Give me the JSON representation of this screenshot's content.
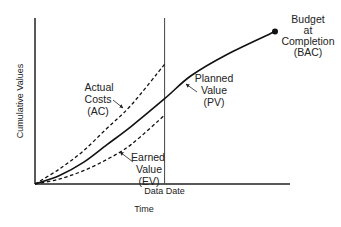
{
  "chart_data": {
    "type": "line",
    "title": "",
    "xlabel": "Time",
    "ylabel": "Cumulative Values",
    "grid": false,
    "data_date_label": "Data Date",
    "data_date_x": 0.54,
    "series": [
      {
        "name": "Planned Value (PV)",
        "label_lines": [
          "Planned",
          "Value",
          "(PV)"
        ],
        "style": "solid",
        "points": [
          [
            0,
            0
          ],
          [
            0.1,
            0.05
          ],
          [
            0.2,
            0.13
          ],
          [
            0.3,
            0.24
          ],
          [
            0.4,
            0.35
          ],
          [
            0.54,
            0.52
          ],
          [
            0.65,
            0.66
          ],
          [
            0.8,
            0.79
          ],
          [
            1.0,
            0.93
          ]
        ]
      },
      {
        "name": "Actual Costs (AC)",
        "label_lines": [
          "Actual",
          "Costs",
          "(AC)"
        ],
        "style": "dashed",
        "points": [
          [
            0,
            0
          ],
          [
            0.1,
            0.09
          ],
          [
            0.2,
            0.2
          ],
          [
            0.3,
            0.34
          ],
          [
            0.4,
            0.48
          ],
          [
            0.54,
            0.73
          ]
        ]
      },
      {
        "name": "Earned Value (EV)",
        "label_lines": [
          "Earned",
          "Value",
          "(EV)"
        ],
        "style": "dashed",
        "points": [
          [
            0,
            0
          ],
          [
            0.1,
            0.03
          ],
          [
            0.2,
            0.08
          ],
          [
            0.3,
            0.15
          ],
          [
            0.4,
            0.24
          ],
          [
            0.54,
            0.42
          ]
        ]
      }
    ],
    "annotations": [
      {
        "name": "Budget at Completion (BAC)",
        "label_lines": [
          "Budget",
          "at",
          "Completion",
          "(BAC)"
        ],
        "point": [
          1.0,
          0.93
        ]
      }
    ]
  }
}
